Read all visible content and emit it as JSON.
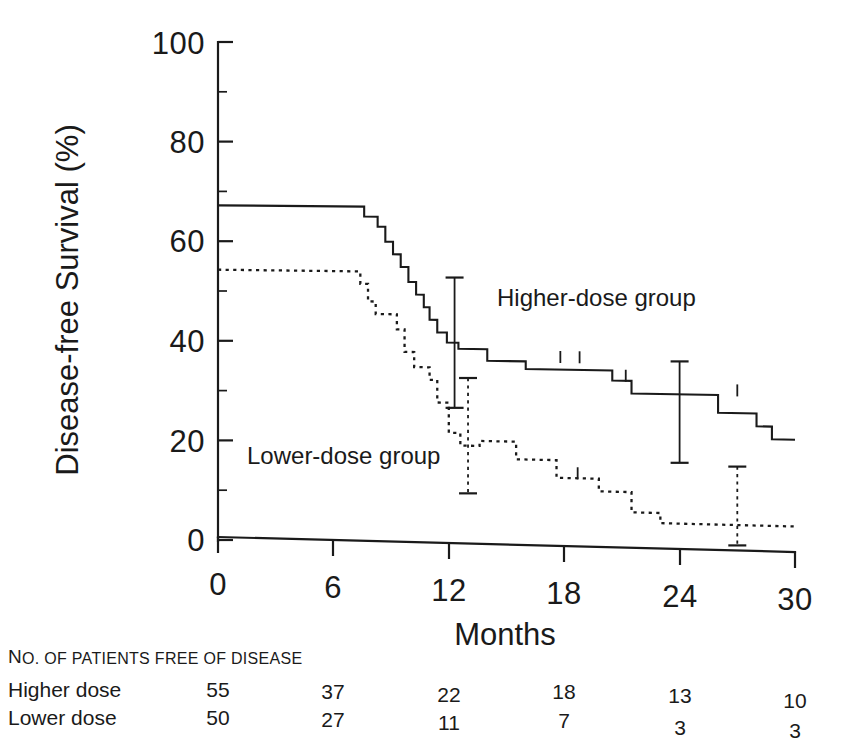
{
  "chart_data": {
    "type": "line",
    "subtype": "kaplan-meier-step",
    "title": "",
    "xlabel": "Months",
    "ylabel": "Disease-free Survival (%)",
    "xlim": [
      0,
      30
    ],
    "ylim": [
      0,
      100
    ],
    "xticks": [
      0,
      6,
      12,
      18,
      24,
      30
    ],
    "xtick_labels": [
      "0",
      "6",
      "12",
      "18",
      "24",
      "30"
    ],
    "yticks": [
      0,
      20,
      40,
      60,
      80,
      100
    ],
    "ytick_labels": [
      "0",
      "20",
      "40",
      "60",
      "80",
      "100"
    ],
    "yminor_ticks": [
      10,
      30,
      50,
      70,
      90
    ],
    "grid": false,
    "legend_position": "in-plot-annotations",
    "series": [
      {
        "name": "Higher-dose group",
        "style": "solid",
        "label_text": "Higher-dose group",
        "label_x": 16.0,
        "label_y": 48.0,
        "steps": [
          [
            0.0,
            67.0
          ],
          [
            7.6,
            67.0
          ],
          [
            7.6,
            65.0
          ],
          [
            8.3,
            65.0
          ],
          [
            8.3,
            63.0
          ],
          [
            8.7,
            63.0
          ],
          [
            8.7,
            60.0
          ],
          [
            9.1,
            60.0
          ],
          [
            9.1,
            57.5
          ],
          [
            9.5,
            57.5
          ],
          [
            9.5,
            55.0
          ],
          [
            9.9,
            55.0
          ],
          [
            9.9,
            52.0
          ],
          [
            10.3,
            52.0
          ],
          [
            10.3,
            49.5
          ],
          [
            10.7,
            49.5
          ],
          [
            10.7,
            47.0
          ],
          [
            11.0,
            47.0
          ],
          [
            11.0,
            44.5
          ],
          [
            11.4,
            44.5
          ],
          [
            11.4,
            42.0
          ],
          [
            11.9,
            42.0
          ],
          [
            11.9,
            40.0
          ],
          [
            12.5,
            40.0
          ],
          [
            12.5,
            38.8
          ],
          [
            14.0,
            38.8
          ],
          [
            14.0,
            36.5
          ],
          [
            16.0,
            36.5
          ],
          [
            16.0,
            35.0
          ],
          [
            20.5,
            35.0
          ],
          [
            20.5,
            33.0
          ],
          [
            21.5,
            33.0
          ],
          [
            21.5,
            30.5
          ],
          [
            26.0,
            30.5
          ],
          [
            26.0,
            27.0
          ],
          [
            28.0,
            27.0
          ],
          [
            28.0,
            24.5
          ],
          [
            28.8,
            24.5
          ],
          [
            28.8,
            22.0
          ],
          [
            30.0,
            22.0
          ]
        ],
        "censor_marks": [
          [
            17.8,
            36.5
          ],
          [
            18.8,
            36.5
          ],
          [
            21.2,
            33.0
          ],
          [
            27.0,
            30.5
          ]
        ],
        "error_bars": [
          {
            "x": 12.3,
            "y": 39.5,
            "low": 27.0,
            "high": 53.0
          },
          {
            "x": 24.0,
            "y": 27.0,
            "low": 17.0,
            "high": 37.0
          }
        ]
      },
      {
        "name": "Lower-dose group",
        "style": "dotted",
        "label_text": "Lower-dose group",
        "label_x": 3.6,
        "label_y": 21.5,
        "steps": [
          [
            0.0,
            54.0
          ],
          [
            7.4,
            54.0
          ],
          [
            7.4,
            51.5
          ],
          [
            7.8,
            51.5
          ],
          [
            7.8,
            48.0
          ],
          [
            8.2,
            48.0
          ],
          [
            8.2,
            45.5
          ],
          [
            9.3,
            45.5
          ],
          [
            9.3,
            42.5
          ],
          [
            9.7,
            42.5
          ],
          [
            9.7,
            38.0
          ],
          [
            10.2,
            38.0
          ],
          [
            10.2,
            35.0
          ],
          [
            11.0,
            35.0
          ],
          [
            11.0,
            32.5
          ],
          [
            11.4,
            32.5
          ],
          [
            11.4,
            28.0
          ],
          [
            12.0,
            28.0
          ],
          [
            12.0,
            22.0
          ],
          [
            12.6,
            22.0
          ],
          [
            12.6,
            19.5
          ],
          [
            13.6,
            19.5
          ],
          [
            13.6,
            20.5
          ],
          [
            15.5,
            20.5
          ],
          [
            15.5,
            17.0
          ],
          [
            17.6,
            17.0
          ],
          [
            17.6,
            13.5
          ],
          [
            19.8,
            13.5
          ],
          [
            19.8,
            11.0
          ],
          [
            21.5,
            11.0
          ],
          [
            21.5,
            7.0
          ],
          [
            23.0,
            7.0
          ],
          [
            23.0,
            5.0
          ],
          [
            30.0,
            5.0
          ]
        ],
        "censor_marks": [
          [
            18.7,
            13.5
          ]
        ],
        "error_bars": [
          {
            "x": 13.0,
            "y": 20.0,
            "low": 10.0,
            "high": 33.0
          },
          {
            "x": 27.0,
            "y": 5.0,
            "low": 1.0,
            "high": 16.5
          }
        ]
      }
    ]
  },
  "risk_table": {
    "header": "NO. OF PATIENTS FREE OF DISEASE",
    "header_first_word": "N",
    "header_rest": "O. OF PATIENTS FREE OF DISEASE",
    "column_times": [
      0,
      6,
      12,
      18,
      24,
      30
    ],
    "rows": [
      {
        "label": "Higher dose",
        "values": [
          "55",
          "37",
          "22",
          "18",
          "13",
          "10"
        ]
      },
      {
        "label": "Lower dose",
        "values": [
          "50",
          "27",
          "11",
          "7",
          "3",
          "3"
        ]
      }
    ]
  },
  "colors": {
    "ink": "#1a1a1a",
    "background": "#ffffff"
  }
}
